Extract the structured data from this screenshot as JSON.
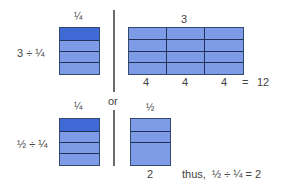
{
  "colors": {
    "block_fill": "#7d9be6",
    "shaded_fill": "#3f6ad6",
    "grid_line": "#22335a",
    "divider": "#6b6b6b",
    "text": "#444444"
  },
  "top": {
    "left_label_top": "¼",
    "left_expression": "3 ÷ ¼",
    "right_label_top": "3",
    "right_col_counts": [
      "4",
      "4",
      "4"
    ],
    "equals": "=",
    "result": "12"
  },
  "separator": {
    "label": "or"
  },
  "bottom": {
    "left_label_top": "¼",
    "left_expression": "½ ÷ ¼",
    "right_label_top": "½",
    "right_count": "2",
    "conclusion": "thus,  ½ ÷ ¼ = 2"
  }
}
